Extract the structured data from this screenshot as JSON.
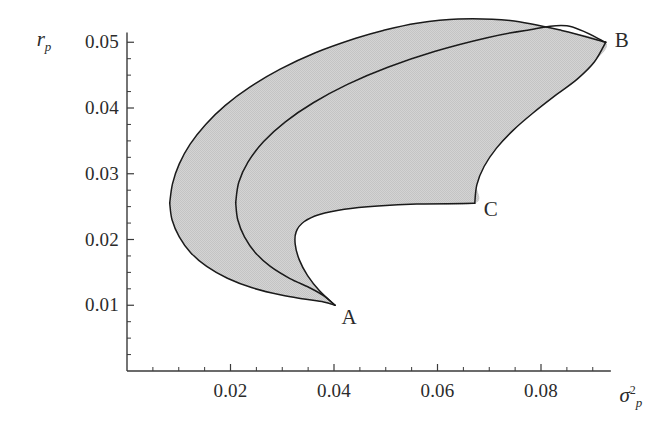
{
  "figure": {
    "background_color": "#ffffff",
    "axis_color": "#3a3a3a",
    "curve_color": "#1a1a1a",
    "fill_color": "#d2d2d2",
    "text_color": "#2b2b2b"
  },
  "chart_data": {
    "type": "line",
    "title": "",
    "xlabel": "sigma_p^2",
    "ylabel": "r_p",
    "xlabel_parts": {
      "symbol": "σ",
      "superscript": "2",
      "subscript": "p"
    },
    "ylabel_parts": {
      "symbol": "r",
      "subscript": "p"
    },
    "grid": false,
    "legend": null,
    "xlim": [
      0.0,
      0.0925
    ],
    "ylim": [
      0.0,
      0.0525
    ],
    "xticks": [
      0.02,
      0.04,
      0.06,
      0.08
    ],
    "xtick_labels": [
      "0.02",
      "0.04",
      "0.06",
      "0.08"
    ],
    "yticks": [
      0.01,
      0.02,
      0.03,
      0.04,
      0.05
    ],
    "ytick_labels": [
      "0.01",
      "0.02",
      "0.03",
      "0.04",
      "0.05"
    ],
    "x_minor_ticks": [
      0.005,
      0.01,
      0.015,
      0.025,
      0.03,
      0.035,
      0.045,
      0.05,
      0.055,
      0.065,
      0.07,
      0.075,
      0.085,
      0.09
    ],
    "y_minor_ticks": [
      0.0025,
      0.005,
      0.0075,
      0.0125,
      0.015,
      0.0175,
      0.0225,
      0.025,
      0.0275,
      0.0325,
      0.035,
      0.0375,
      0.0425,
      0.045,
      0.0475
    ],
    "annotations": [
      {
        "label": "A",
        "x": 0.0402,
        "y": 0.01
      },
      {
        "label": "B",
        "x": 0.0925,
        "y": 0.05
      },
      {
        "label": "C",
        "x": 0.0672,
        "y": 0.0255
      }
    ],
    "series": [
      {
        "name": "outer-frontier-upper",
        "comment": "outer hyperbola upper branch, left vertex to B",
        "points": [
          [
            0.00825,
            0.02555
          ],
          [
            0.0088,
            0.0285
          ],
          [
            0.0101,
            0.0315
          ],
          [
            0.0122,
            0.0345
          ],
          [
            0.0152,
            0.0375
          ],
          [
            0.019,
            0.0404
          ],
          [
            0.0238,
            0.0432
          ],
          [
            0.0296,
            0.0459
          ],
          [
            0.0364,
            0.0484
          ],
          [
            0.0442,
            0.0506
          ],
          [
            0.0495,
            0.0518
          ],
          [
            0.056,
            0.0529
          ],
          [
            0.064,
            0.05355
          ],
          [
            0.074,
            0.0533
          ],
          [
            0.084,
            0.0518
          ],
          [
            0.0925,
            0.05
          ]
        ]
      },
      {
        "name": "outer-frontier-lower",
        "comment": "outer hyperbola lower branch, left vertex to A",
        "points": [
          [
            0.00825,
            0.02555
          ],
          [
            0.0087,
            0.023
          ],
          [
            0.0101,
            0.0204
          ],
          [
            0.0123,
            0.018
          ],
          [
            0.0154,
            0.0159
          ],
          [
            0.0194,
            0.0141
          ],
          [
            0.0242,
            0.01265
          ],
          [
            0.0298,
            0.01155
          ],
          [
            0.0342,
            0.01095
          ],
          [
            0.038,
            0.0105
          ],
          [
            0.0402,
            0.01
          ]
        ]
      },
      {
        "name": "middle-frontier-upper",
        "comment": "inner hyperbola upper branch from its vertex to B",
        "points": [
          [
            0.021,
            0.0256
          ],
          [
            0.0216,
            0.0287
          ],
          [
            0.0234,
            0.0318
          ],
          [
            0.0264,
            0.0349
          ],
          [
            0.0306,
            0.0379
          ],
          [
            0.036,
            0.0408
          ],
          [
            0.0426,
            0.0436
          ],
          [
            0.0504,
            0.0462
          ],
          [
            0.0594,
            0.0486
          ],
          [
            0.0696,
            0.0507
          ],
          [
            0.077,
            0.0518
          ],
          [
            0.085,
            0.0525
          ],
          [
            0.0925,
            0.05
          ]
        ]
      },
      {
        "name": "middle-frontier-lower",
        "comment": "inner hyperbola lower branch from its vertex down to A",
        "points": [
          [
            0.021,
            0.0256
          ],
          [
            0.0214,
            0.023
          ],
          [
            0.0227,
            0.0204
          ],
          [
            0.0248,
            0.018
          ],
          [
            0.0277,
            0.0159
          ],
          [
            0.0314,
            0.0141
          ],
          [
            0.0352,
            0.0127
          ],
          [
            0.0379,
            0.0115
          ],
          [
            0.0402,
            0.01
          ]
        ]
      },
      {
        "name": "constrained-frontier-lower",
        "comment": "A to C lower boundary of shaded region",
        "points": [
          [
            0.0402,
            0.01
          ],
          [
            0.0372,
            0.0122
          ],
          [
            0.0349,
            0.0145
          ],
          [
            0.0333,
            0.0169
          ],
          [
            0.0325,
            0.0193
          ],
          [
            0.0327,
            0.0212
          ],
          [
            0.0342,
            0.0227
          ],
          [
            0.0372,
            0.0238
          ],
          [
            0.042,
            0.0246
          ],
          [
            0.0485,
            0.0251
          ],
          [
            0.056,
            0.0254
          ],
          [
            0.0672,
            0.0255
          ]
        ]
      },
      {
        "name": "constrained-frontier-right",
        "comment": "C up to B right boundary, bulging rightward",
        "points": [
          [
            0.0672,
            0.0255
          ],
          [
            0.0676,
            0.0283
          ],
          [
            0.069,
            0.0311
          ],
          [
            0.0714,
            0.0339
          ],
          [
            0.0746,
            0.0366
          ],
          [
            0.0784,
            0.0392
          ],
          [
            0.0826,
            0.0418
          ],
          [
            0.087,
            0.0444
          ],
          [
            0.0903,
            0.047
          ],
          [
            0.0925,
            0.05
          ]
        ]
      }
    ]
  },
  "axis_marks": {
    "x_axis_label": "σ",
    "y_axis_label": "r"
  }
}
